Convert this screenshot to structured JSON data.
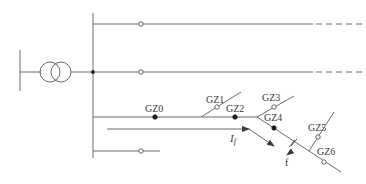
{
  "diagram": {
    "title": "",
    "colors": {
      "line": "#5a5a5a",
      "closed_switch": "#1a1a1a",
      "open_switch_fill": "#ffffff",
      "text": "#3a3a3a",
      "background": "#ffffff"
    },
    "source": {
      "symbol": "transformer-two-winding"
    },
    "feeders": [
      {
        "id": "feeder-1",
        "continues": "dashed"
      },
      {
        "id": "feeder-2",
        "continues": "dashed"
      },
      {
        "id": "feeder-3-faulted"
      },
      {
        "id": "feeder-4"
      }
    ],
    "switches": [
      {
        "label": "GZ0",
        "state": "closed"
      },
      {
        "label": "GZ1",
        "state": "open"
      },
      {
        "label": "GZ2",
        "state": "closed"
      },
      {
        "label": "GZ3",
        "state": "open"
      },
      {
        "label": "GZ4",
        "state": "closed"
      },
      {
        "label": "GZ5",
        "state": "open"
      },
      {
        "label": "GZ6",
        "state": "open"
      }
    ],
    "current_label": "I",
    "current_subscript": "f",
    "fault_label": "f"
  }
}
